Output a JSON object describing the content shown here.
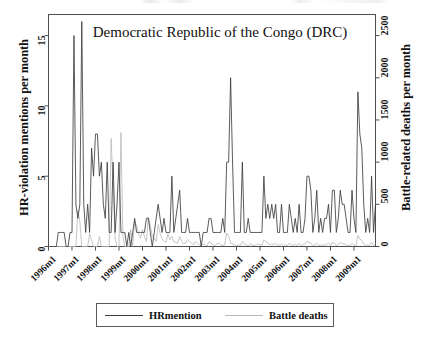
{
  "chart_data": {
    "type": "line",
    "title": "Democratic Republic of the Congo (DRC)",
    "xlabel": "",
    "ylabel": "HR-violation mentions per month",
    "ylabel_secondary": "Battle-related deaths per month",
    "grid": false,
    "legend_position": "bottom",
    "xlim": [
      "1996m1",
      "2009m12"
    ],
    "ylim": [
      0,
      16.5
    ],
    "ylim_secondary": [
      0,
      2750
    ],
    "yticks": [
      0,
      5,
      10,
      15
    ],
    "ytick_labels": [
      "0",
      "5",
      "10",
      "15"
    ],
    "yticks_secondary": [
      0,
      500,
      1000,
      1500,
      2000,
      2500
    ],
    "ytick_labels_secondary": [
      "0",
      "500",
      "1000",
      "1500",
      "2000",
      "2500"
    ],
    "xticks": [
      "1996m1",
      "1997m1",
      "1998m1",
      "1999m1",
      "2000m1",
      "2001m1",
      "2002m1",
      "2003m1",
      "2004m1",
      "2005m1",
      "2006m1",
      "2007m1",
      "2008m1",
      "2009m1"
    ],
    "x_start_year": 1996,
    "x_start_month": 1,
    "n_points": 168,
    "series": [
      {
        "name": "HRmention",
        "color": "#3d3d3d",
        "axis": "left",
        "values": [
          0,
          0,
          0,
          0,
          0,
          1,
          1,
          1,
          1,
          0,
          0,
          1,
          1,
          15,
          3,
          2,
          3,
          16,
          3,
          1,
          3,
          1,
          7,
          5,
          8,
          8,
          5,
          6,
          3,
          2,
          6,
          1,
          1,
          6,
          1,
          3,
          6,
          1,
          1,
          1,
          0,
          1,
          0,
          1,
          2,
          1,
          1,
          1,
          1,
          1,
          2,
          2,
          1,
          0,
          1,
          2,
          3,
          2,
          1,
          2,
          1,
          1,
          1,
          5,
          1,
          2,
          3,
          4,
          1,
          1,
          1,
          2,
          1,
          1,
          1,
          1,
          1,
          1,
          0,
          1,
          1,
          1,
          2,
          2,
          1,
          1,
          1,
          1,
          1,
          2,
          1,
          6,
          6,
          12,
          6,
          1,
          1,
          1,
          1,
          6,
          1,
          1,
          2,
          1,
          1,
          1,
          1,
          1,
          1,
          1,
          5,
          2,
          3,
          2,
          3,
          2,
          3,
          1,
          1,
          3,
          1,
          1,
          1,
          3,
          2,
          1,
          2,
          1,
          3,
          1,
          1,
          2,
          5,
          5,
          4,
          1,
          2,
          4,
          1,
          2,
          1,
          2,
          2,
          3,
          1,
          4,
          4,
          1,
          2,
          4,
          3,
          3,
          2,
          1,
          1,
          4,
          2,
          1,
          11,
          8,
          7,
          3,
          1,
          2,
          1,
          5,
          1,
          3
        ]
      },
      {
        "name": "Battle deaths",
        "color": "#b8b8b8",
        "axis": "right",
        "values": [
          0,
          0,
          0,
          0,
          0,
          0,
          0,
          0,
          0,
          0,
          0,
          0,
          0,
          0,
          0,
          430,
          300,
          0,
          0,
          0,
          0,
          150,
          80,
          0,
          0,
          0,
          120,
          0,
          0,
          0,
          0,
          0,
          1280,
          700,
          100,
          0,
          0,
          1350,
          120,
          0,
          0,
          0,
          200,
          0,
          300,
          250,
          150,
          100,
          200,
          120,
          60,
          350,
          250,
          120,
          100,
          60,
          260,
          160,
          90,
          60,
          50,
          150,
          80,
          120,
          60,
          50,
          40,
          120,
          60,
          30,
          40,
          80,
          60,
          40,
          20,
          60,
          40,
          20,
          10,
          30,
          20,
          10,
          60,
          40,
          20,
          10,
          30,
          40,
          20,
          10,
          20,
          160,
          120,
          40,
          30,
          20,
          10,
          20,
          10,
          60,
          30,
          20,
          10,
          30,
          20,
          10,
          20,
          30,
          20,
          10,
          80,
          60,
          40,
          20,
          30,
          20,
          40,
          10,
          20,
          30,
          10,
          20,
          10,
          40,
          20,
          10,
          30,
          10,
          40,
          10,
          20,
          30,
          60,
          50,
          40,
          10,
          20,
          40,
          10,
          20,
          10,
          20,
          20,
          40,
          10,
          50,
          40,
          10,
          20,
          50,
          30,
          30,
          20,
          10,
          10,
          40,
          20,
          10,
          130,
          90,
          70,
          30,
          10,
          20,
          10,
          50,
          10,
          30
        ]
      }
    ]
  },
  "legend": {
    "entries": [
      {
        "label": "HRmention"
      },
      {
        "label": "Battle deaths"
      }
    ]
  },
  "colors": {
    "hrmention": "#3d3d3d",
    "battle_deaths": "#b8b8b8",
    "frame": "#4d4d4d",
    "text": "#111111",
    "background": "#ffffff"
  }
}
